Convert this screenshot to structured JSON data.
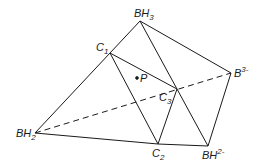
{
  "diagram": {
    "title": "",
    "vertices": {
      "C1": {
        "label": "C",
        "sub": "1",
        "sup": "",
        "x": 110,
        "y": 53
      },
      "BH3": {
        "label": "BH",
        "sub": "3",
        "sup": "",
        "x": 140,
        "y": 21
      },
      "B3m": {
        "label": "B",
        "sub": "",
        "sup": "3-",
        "x": 231,
        "y": 73
      },
      "BH2m": {
        "label": "BH",
        "sub": "",
        "sup": "2-",
        "x": 208,
        "y": 146
      },
      "C2": {
        "label": "C",
        "sub": "2",
        "sup": "",
        "x": 158,
        "y": 144
      },
      "C3": {
        "label": "C",
        "sub": "3",
        "sup": "",
        "x": 177,
        "y": 89
      },
      "BH2": {
        "label": "BH",
        "sub": "2",
        "sup": "",
        "x": 35,
        "y": 133
      }
    },
    "point_p": {
      "label": "P",
      "x": 141,
      "y": 81
    },
    "edges_solid": [
      [
        "BH2",
        "C1"
      ],
      [
        "C1",
        "BH3"
      ],
      [
        "BH3",
        "B3m"
      ],
      [
        "B3m",
        "BH2m"
      ],
      [
        "BH2m",
        "C2"
      ],
      [
        "C2",
        "BH2"
      ],
      [
        "C1",
        "C3"
      ],
      [
        "C1",
        "C2"
      ],
      [
        "C3",
        "C2"
      ],
      [
        "BH3",
        "BH2m"
      ]
    ],
    "edges_dashed": [
      [
        "BH2",
        "B3m"
      ]
    ],
    "labels": {
      "C1": "C",
      "C1_sub": "1",
      "BH3": "BH",
      "BH3_sub": "3",
      "B3m": "B",
      "B3m_sup": "3-",
      "BH2m": "BH",
      "BH2m_sup": "2-",
      "C2": "C",
      "C2_sub": "2",
      "C3": "C",
      "C3_sub": "3",
      "BH2": "BH",
      "BH2_sub": "2",
      "P": "P"
    }
  }
}
